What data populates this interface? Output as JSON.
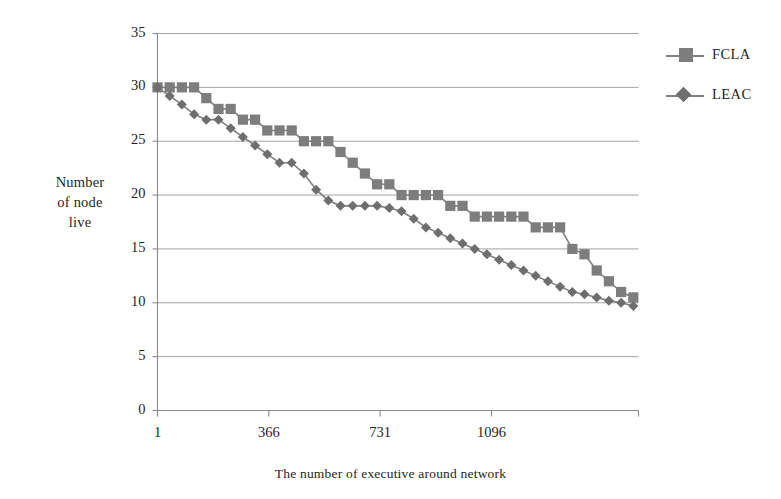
{
  "chart_data": {
    "type": "line",
    "title": "",
    "xlabel": "The number of executive around network",
    "ylabel": "Number of node live",
    "ylabel_lines": [
      "Number",
      "of node",
      "live"
    ],
    "xlim": [
      1,
      1578
    ],
    "ylim": [
      0,
      35
    ],
    "y_ticks": [
      0,
      5,
      10,
      15,
      20,
      25,
      30,
      35
    ],
    "x_ticks": [
      1,
      366,
      731,
      1096
    ],
    "x_tick_labels": [
      "1",
      "366",
      "731",
      "1096"
    ],
    "grid": true,
    "legend_position": "right",
    "marker_color": "#7d7d7d",
    "line_color": "#808080",
    "grid_color": "#9a9a9a",
    "axis_color": "#8a8a8a",
    "x": [
      1,
      41,
      81,
      121,
      161,
      201,
      241,
      281,
      321,
      361,
      401,
      441,
      481,
      521,
      561,
      601,
      641,
      681,
      721,
      761,
      801,
      841,
      881,
      921,
      961,
      1001,
      1041,
      1081,
      1121,
      1161,
      1201,
      1241,
      1281,
      1321,
      1361,
      1401,
      1441,
      1481,
      1521,
      1561
    ],
    "series": [
      {
        "name": "FCLA",
        "marker": "square",
        "values": [
          30,
          30,
          30,
          30,
          29,
          28,
          28,
          27,
          27,
          26,
          26,
          26,
          25,
          25,
          25,
          24,
          23,
          22,
          21,
          21,
          20,
          20,
          20,
          20,
          19,
          19,
          18,
          18,
          18,
          18,
          18,
          17,
          17,
          17,
          15,
          14.5,
          13,
          12,
          11,
          10.5
        ]
      },
      {
        "name": "LEAC",
        "marker": "diamond",
        "values": [
          30,
          29.2,
          28.4,
          27.5,
          27,
          27,
          26.2,
          25.4,
          24.6,
          23.8,
          23,
          23,
          22,
          20.5,
          19.5,
          19,
          19,
          19,
          19,
          18.8,
          18.5,
          17.8,
          17,
          16.5,
          16,
          15.5,
          15,
          14.5,
          14,
          13.5,
          13,
          12.5,
          12,
          11.5,
          11,
          10.8,
          10.5,
          10.2,
          10,
          9.7
        ]
      }
    ]
  },
  "legend": {
    "items": [
      {
        "label": "FCLA",
        "marker": "square"
      },
      {
        "label": "LEAC",
        "marker": "diamond"
      }
    ]
  }
}
